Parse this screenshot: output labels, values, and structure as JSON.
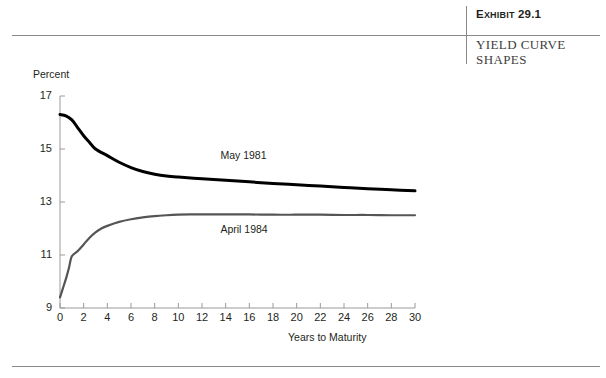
{
  "header": {
    "exhibit_number": "Exhibit 29.1",
    "exhibit_number_prefix": "E",
    "exhibit_number_caps": "XHIBIT",
    "exhibit_number_value": " 29.1",
    "exhibit_title": "YIELD CURVE SHAPES"
  },
  "chart_data": {
    "type": "line",
    "title": "YIELD CURVE SHAPES",
    "xlabel": "Years to Maturity",
    "ylabel": "Percent",
    "xlim": [
      0,
      30
    ],
    "ylim": [
      9,
      17
    ],
    "xticks": [
      0,
      2,
      4,
      6,
      8,
      10,
      12,
      14,
      16,
      18,
      20,
      22,
      24,
      26,
      28,
      30
    ],
    "yticks": [
      9,
      11,
      13,
      15,
      17
    ],
    "xtick_labels": [
      "0",
      "2",
      "4",
      "6",
      "8",
      "10",
      "12",
      "14",
      "16",
      "18",
      "20",
      "22",
      "24",
      "26",
      "28",
      "30"
    ],
    "ytick_labels": [
      "9",
      "11",
      "13",
      "15",
      "17"
    ],
    "grid": false,
    "legend_position": "inline-annotations",
    "series": [
      {
        "name": "May 1981",
        "color": "#000000",
        "line_width": 3.0,
        "shape": "inverted / downward sloping",
        "label_x": 16.6,
        "label_y": 14.75,
        "x": [
          0,
          0.5,
          1,
          1.5,
          2,
          2.5,
          3,
          4,
          5,
          6,
          7,
          8,
          9,
          10,
          12,
          14,
          16,
          18,
          20,
          22,
          24,
          26,
          28,
          30
        ],
        "y": [
          16.3,
          16.25,
          16.1,
          15.8,
          15.5,
          15.25,
          15.0,
          14.75,
          14.5,
          14.3,
          14.15,
          14.05,
          13.98,
          13.94,
          13.88,
          13.82,
          13.76,
          13.7,
          13.65,
          13.6,
          13.55,
          13.5,
          13.46,
          13.42
        ]
      },
      {
        "name": "April 1984",
        "color": "#555555",
        "line_width": 2.2,
        "shape": "normal / upward sloping",
        "label_x": 16.6,
        "label_y": 11.95,
        "x": [
          0,
          0.25,
          0.5,
          0.75,
          1,
          1.5,
          2,
          2.5,
          3,
          3.5,
          4,
          5,
          6,
          7,
          8,
          9,
          10,
          11,
          12,
          14,
          16,
          18,
          20,
          22,
          24,
          26,
          28,
          30
        ],
        "y": [
          9.4,
          9.75,
          10.1,
          10.5,
          10.95,
          11.15,
          11.4,
          11.65,
          11.85,
          12.0,
          12.1,
          12.25,
          12.35,
          12.42,
          12.47,
          12.5,
          12.52,
          12.53,
          12.53,
          12.53,
          12.53,
          12.52,
          12.52,
          12.52,
          12.51,
          12.51,
          12.5,
          12.5
        ]
      }
    ]
  },
  "axis": {
    "axis_color": "#9a9a9a",
    "tick_color": "#9a9a9a"
  }
}
